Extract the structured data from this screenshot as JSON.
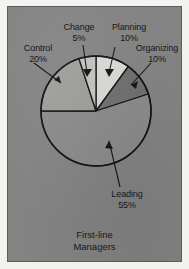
{
  "figure": {
    "caption_line1": "First-line",
    "caption_line2": "Managers",
    "panel_color": "#838383",
    "outline_color": "#17171a"
  },
  "chart_data": {
    "type": "pie",
    "title": "First-line Managers",
    "categories": [
      "Planning",
      "Organizing",
      "Leading",
      "Control",
      "Change"
    ],
    "values": [
      10,
      10,
      55,
      20,
      5
    ],
    "value_unit": "%",
    "labels": [
      {
        "name": "Planning",
        "pct": "10%",
        "color": "#d8d8d4"
      },
      {
        "name": "Organizing",
        "pct": "10%",
        "color": "#6f6f6f"
      },
      {
        "name": "Leading",
        "pct": "55%",
        "color": "#8a8a8a"
      },
      {
        "name": "Control",
        "pct": "20%",
        "color": "#9d9d9a"
      },
      {
        "name": "Change",
        "pct": "5%",
        "color": "#c2c2be"
      }
    ],
    "legend_position": "annotated-callouts",
    "grid": false,
    "start_angle_deg": -90,
    "direction": "clockwise"
  },
  "annotations": {
    "control": {
      "name": "Control",
      "pct": "20%"
    },
    "change": {
      "name": "Change",
      "pct": "5%"
    },
    "planning": {
      "name": "Planning",
      "pct": "10%"
    },
    "organizing": {
      "name": "Organizing",
      "pct": "10%"
    },
    "leading": {
      "name": "Leading",
      "pct": "55%"
    }
  }
}
